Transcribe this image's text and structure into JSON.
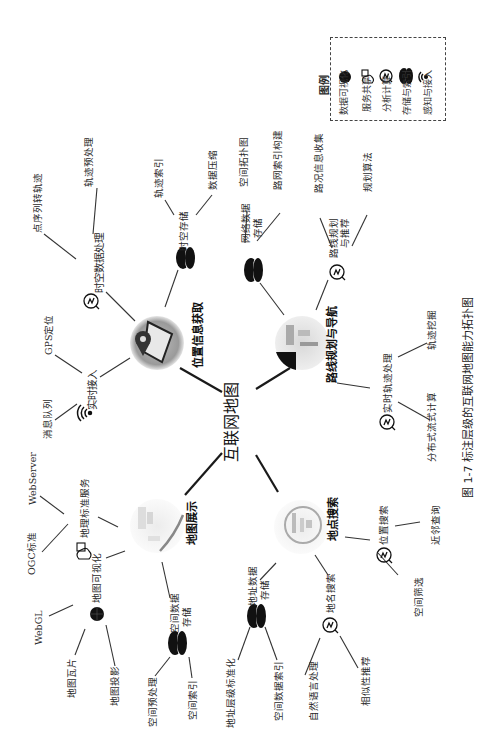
{
  "figure": {
    "caption": "图 1-7  标注层级的互联网地图能力拓扑图",
    "center": "互联网地图",
    "page_number": "…"
  },
  "legend": {
    "title": "图例",
    "items": [
      {
        "icon": "globe-icon",
        "label": "数据可视化"
      },
      {
        "icon": "cloud-service-icon",
        "label": "服务共享"
      },
      {
        "icon": "analytics-icon",
        "label": "分析计算"
      },
      {
        "icon": "database-icon",
        "label": "存储与索引"
      },
      {
        "icon": "wifi-signal-icon",
        "label": "感知与接入"
      }
    ]
  },
  "modules": {
    "location": {
      "title": "位置信息获取",
      "realtime_access": {
        "label": "实时接入",
        "icon": "wifi-signal-icon",
        "children": [
          "消息队列",
          "GPS定位"
        ]
      },
      "st_processing": {
        "label": "时空数据处理",
        "icon": "analytics-icon",
        "children": [
          "点序列转轨迹",
          "轨迹预处理"
        ]
      },
      "st_storage": {
        "label": "时空存储",
        "icon": "database-icon",
        "children": [
          "轨迹索引",
          "数据压缩"
        ]
      }
    },
    "routing": {
      "title": "路线规划与导航",
      "network_storage": {
        "label": "网络数据存储",
        "line1": "网络数据",
        "line2": "存储",
        "icon": "database-icon",
        "children": [
          "空间拓扑图",
          "路网索引构建"
        ]
      },
      "route_planning": {
        "label": "路线规划与推荐",
        "line1": "路线规划",
        "line2": "与推荐",
        "icon": "analytics-icon",
        "children": [
          "路况信息收集",
          "规划算法"
        ]
      },
      "realtime_traj": {
        "label": "实时轨迹处理",
        "icon": "analytics-icon",
        "children": [
          "分布式流式计算",
          "轨迹挖掘"
        ]
      }
    },
    "display": {
      "title": "地图展示",
      "geo_service": {
        "label": "地理标准服务",
        "icon": "cloud-service-icon",
        "children": [
          "WebServer",
          "OGC标准"
        ]
      },
      "map_vis": {
        "label": "地图可视化",
        "icon": "globe-icon",
        "children": [
          "WebGL",
          "地图瓦片",
          "地图投影"
        ]
      },
      "spatial_storage": {
        "label": "空间数据存储",
        "line1": "空间数据",
        "line2": "存储",
        "icon": "database-icon",
        "children": [
          "空间预处理",
          "空间索引"
        ]
      }
    },
    "poi": {
      "title": "地点搜索",
      "addr_storage": {
        "label": "地址数据存储",
        "line1": "地址数据",
        "line2": "存储",
        "icon": "database-icon",
        "children": [
          "地址层级标准化",
          "空间数据索引"
        ]
      },
      "name_search": {
        "label": "地名搜索",
        "icon": "analytics-icon",
        "children": [
          "自然语言处理",
          "相似性推荐"
        ]
      },
      "loc_search": {
        "label": "位置搜索",
        "icon": "analytics-icon",
        "children": [
          "近邻查询",
          "空间筛选"
        ]
      }
    }
  },
  "colors": {
    "line": "#222222",
    "text": "#2a2a2a",
    "background": "#ffffff"
  }
}
